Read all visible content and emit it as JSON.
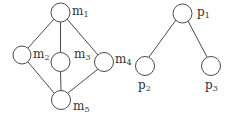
{
  "diagram": {
    "type": "graph",
    "left_graph": {
      "nodes": [
        {
          "id": "m1",
          "label": "m",
          "sub": "1",
          "cx": 60.5,
          "cy": 12.5
        },
        {
          "id": "m2",
          "label": "m",
          "sub": "2",
          "cx": 22,
          "cy": 55
        },
        {
          "id": "m3",
          "label": "m",
          "sub": "3",
          "cx": 60.5,
          "cy": 62
        },
        {
          "id": "m4",
          "label": "m",
          "sub": "4",
          "cx": 104,
          "cy": 62
        },
        {
          "id": "m5",
          "label": "m",
          "sub": "5",
          "cx": 61,
          "cy": 100
        }
      ],
      "edges": [
        [
          "m1",
          "m2"
        ],
        [
          "m1",
          "m3"
        ],
        [
          "m1",
          "m4"
        ],
        [
          "m2",
          "m5"
        ],
        [
          "m3",
          "m5"
        ],
        [
          "m4",
          "m5"
        ]
      ]
    },
    "right_graph": {
      "nodes": [
        {
          "id": "p1",
          "label": "p",
          "sub": "1",
          "cx": 182.5,
          "cy": 13.5
        },
        {
          "id": "p2",
          "label": "p",
          "sub": "2",
          "cx": 145,
          "cy": 66
        },
        {
          "id": "p3",
          "label": "p",
          "sub": "3",
          "cx": 211,
          "cy": 66
        }
      ],
      "edges": [
        [
          "p1",
          "p2"
        ],
        [
          "p1",
          "p3"
        ]
      ]
    },
    "colors": {
      "stroke": "#4a4a4a",
      "text": "#333333",
      "background": "#ffffff"
    }
  }
}
